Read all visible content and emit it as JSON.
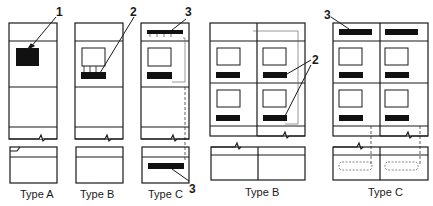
{
  "diagram": {
    "panels": [
      {
        "id": "single-type-a",
        "caption": "Type A"
      },
      {
        "id": "single-type-b",
        "caption": "Type B"
      },
      {
        "id": "single-type-c",
        "caption": "Type C"
      },
      {
        "id": "double-type-b",
        "caption": "Type B"
      },
      {
        "id": "double-type-c",
        "caption": "Type C"
      }
    ],
    "callouts": {
      "one": "1",
      "two_a": "2",
      "two_b": "2",
      "three_top_single": "3",
      "three_bottom_single": "3",
      "three_double": "3"
    },
    "colors": {
      "line": "#1a1a1a",
      "fill": "#111111",
      "thin": "#555555"
    }
  }
}
